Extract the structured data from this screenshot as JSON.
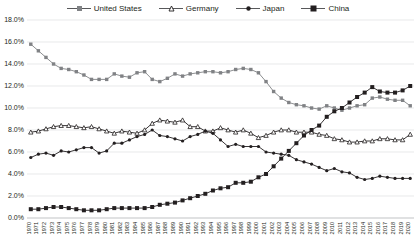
{
  "chart_data": {
    "type": "line",
    "title": "",
    "xlabel": "",
    "ylabel": "",
    "ylim": [
      0,
      18
    ],
    "ytick_step": 2,
    "grid": true,
    "legend_position": "top-center",
    "ytick_labels": [
      "18.0%",
      "16.0%",
      "14.0%",
      "12.0%",
      "10.0%",
      "8.0%",
      "6.0%",
      "4.0%",
      "2.0%",
      "0.0%"
    ],
    "categories": [
      "1970",
      "1971",
      "1972",
      "1973",
      "1974",
      "1975",
      "1976",
      "1977",
      "1978",
      "1979",
      "1980",
      "1981",
      "1982",
      "1983",
      "1984",
      "1985",
      "1986",
      "1987",
      "1988",
      "1989",
      "1990",
      "1991",
      "1992",
      "1993",
      "1994",
      "1995",
      "1996",
      "1997",
      "1998",
      "1999",
      "2000",
      "2001",
      "2002",
      "2003",
      "2004",
      "2005",
      "2006",
      "2007",
      "2008",
      "2009",
      "2010",
      "2011",
      "2012",
      "2013",
      "2014",
      "2015",
      "2016",
      "2017",
      "2018",
      "2019",
      "2020"
    ],
    "series": [
      {
        "name": "United States",
        "marker": "square",
        "color": "#808285",
        "values": [
          15.8,
          15.2,
          14.6,
          14.0,
          13.6,
          13.5,
          13.3,
          13.0,
          12.6,
          12.6,
          12.6,
          13.1,
          12.9,
          12.8,
          13.2,
          13.3,
          12.6,
          12.4,
          12.7,
          13.1,
          12.9,
          13.1,
          13.2,
          13.3,
          13.3,
          13.2,
          13.3,
          13.5,
          13.6,
          13.5,
          13.2,
          12.4,
          11.5,
          10.9,
          10.5,
          10.3,
          10.2,
          10.0,
          9.9,
          10.2,
          10.0,
          9.8,
          10.0,
          10.2,
          10.3,
          10.9,
          11.0,
          10.8,
          10.7,
          10.7,
          10.2
        ]
      },
      {
        "name": "Germany",
        "marker": "triangle",
        "color": "#231f20",
        "values": [
          7.8,
          7.9,
          8.1,
          8.3,
          8.4,
          8.4,
          8.3,
          8.2,
          8.3,
          8.1,
          7.9,
          7.7,
          7.9,
          7.8,
          7.7,
          8.0,
          8.6,
          8.9,
          8.8,
          8.7,
          8.9,
          8.3,
          8.3,
          7.9,
          7.9,
          8.2,
          8.0,
          7.8,
          8.0,
          7.7,
          7.3,
          7.5,
          7.8,
          8.0,
          8.0,
          7.8,
          7.8,
          7.8,
          7.6,
          7.5,
          7.2,
          7.1,
          6.9,
          6.9,
          7.0,
          7.0,
          7.2,
          7.2,
          7.1,
          7.1,
          7.6
        ]
      },
      {
        "name": "Japan",
        "marker": "circle",
        "color": "#231f20",
        "values": [
          5.5,
          5.8,
          5.9,
          5.7,
          6.1,
          6.0,
          6.2,
          6.4,
          6.4,
          5.9,
          6.1,
          6.8,
          6.8,
          7.1,
          7.4,
          7.6,
          8.0,
          7.5,
          7.4,
          7.2,
          7.0,
          7.4,
          7.6,
          7.9,
          7.7,
          7.1,
          6.5,
          6.7,
          6.5,
          6.5,
          6.5,
          6.0,
          5.9,
          5.8,
          5.7,
          5.3,
          5.1,
          4.9,
          4.6,
          4.3,
          4.5,
          4.2,
          4.1,
          3.7,
          3.5,
          3.6,
          3.8,
          3.7,
          3.6,
          3.6,
          3.6
        ]
      },
      {
        "name": "China",
        "marker": "filled-square",
        "color": "#231f20",
        "values": [
          0.8,
          0.8,
          0.9,
          1.0,
          1.0,
          0.9,
          0.8,
          0.7,
          0.7,
          0.7,
          0.8,
          0.9,
          0.9,
          0.9,
          0.9,
          0.9,
          1.0,
          1.2,
          1.3,
          1.4,
          1.6,
          1.8,
          2.0,
          2.2,
          2.5,
          2.7,
          2.8,
          3.2,
          3.2,
          3.3,
          3.7,
          4.0,
          4.7,
          5.4,
          6.1,
          6.8,
          7.5,
          8.0,
          8.4,
          9.2,
          9.7,
          10.0,
          10.5,
          11.0,
          11.4,
          11.9,
          11.5,
          11.4,
          11.4,
          11.6,
          12.0
        ]
      }
    ]
  },
  "legend": {
    "items": [
      {
        "label": "United States"
      },
      {
        "label": "Germany"
      },
      {
        "label": "Japan"
      },
      {
        "label": "China"
      }
    ]
  }
}
